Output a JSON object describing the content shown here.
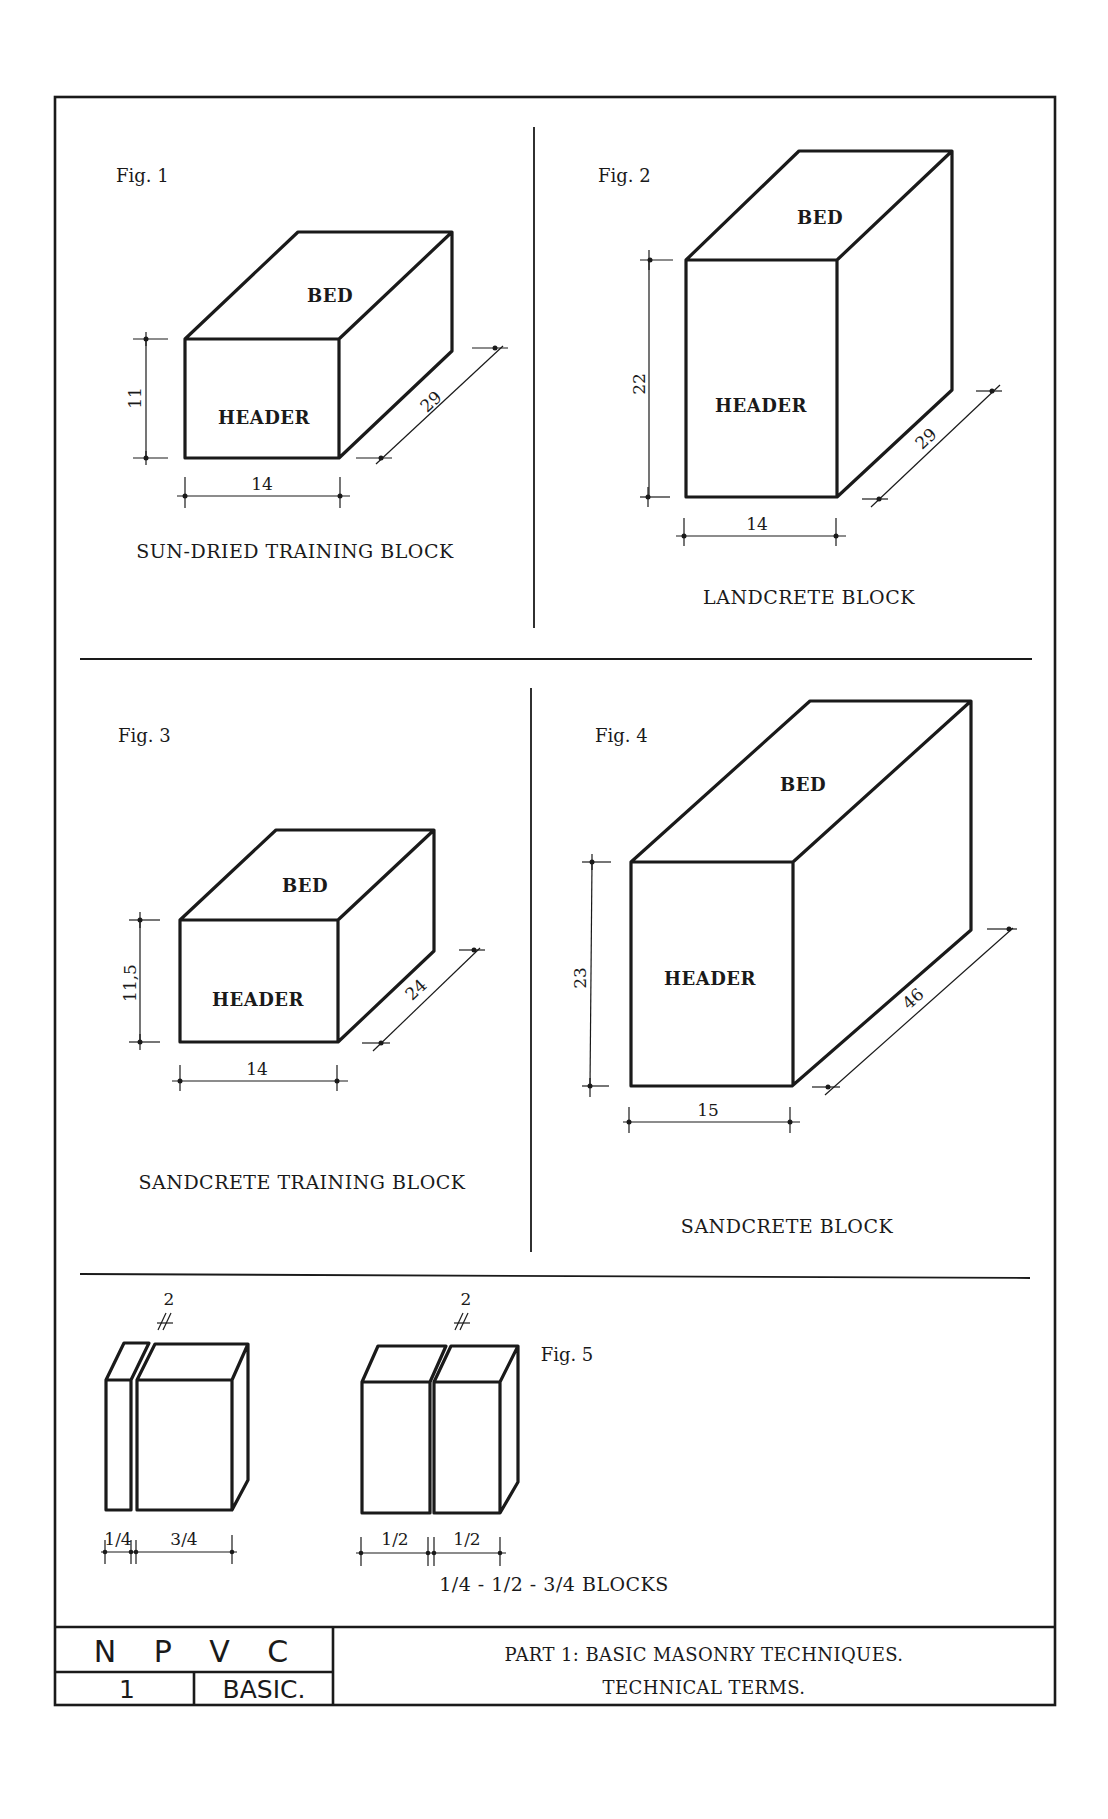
{
  "title_block": {
    "org": "N P V C",
    "number": "1",
    "level": "BASIC.",
    "title_line1": "PART 1:  BASIC MASONRY TECHNIQUES.",
    "title_line2": "TECHNICAL TERMS."
  },
  "figures": [
    {
      "label": "Fig. 1",
      "caption": "SUN-DRIED TRAINING BLOCK",
      "top_face": "BED",
      "front_face": "HEADER",
      "height": "11",
      "width": "14",
      "length": "29"
    },
    {
      "label": "Fig. 2",
      "caption": "LANDCRETE BLOCK",
      "top_face": "BED",
      "front_face": "HEADER",
      "height": "22",
      "width": "14",
      "length": "29"
    },
    {
      "label": "Fig. 3",
      "caption": "SANDCRETE TRAINING BLOCK",
      "top_face": "BED",
      "front_face": "HEADER",
      "height": "11,5",
      "width": "14",
      "length": "24"
    },
    {
      "label": "Fig. 4",
      "caption": "SANDCRETE BLOCK",
      "top_face": "BED",
      "front_face": "HEADER",
      "height": "23",
      "width": "15",
      "length": "46"
    },
    {
      "label": "Fig. 5",
      "caption": "1/4 - 1/2 - 3/4 BLOCKS",
      "left_group": {
        "joint": "2",
        "parts": [
          "1/4",
          "3/4"
        ]
      },
      "right_group": {
        "joint": "2",
        "parts": [
          "1/2",
          "1/2"
        ]
      }
    }
  ],
  "colors": {
    "ink": "#1a1a1a",
    "paper": "#ffffff"
  }
}
